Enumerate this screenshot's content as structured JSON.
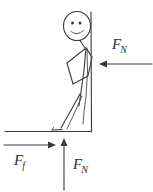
{
  "figure": {
    "type": "free-body-diagram",
    "title": "",
    "stroke_color": "#3a3a3a",
    "background_color": "#ffffff",
    "width": 153,
    "height": 192
  },
  "labels": {
    "normal_force_wall": {
      "base": "F",
      "subscript": "N"
    },
    "friction_force": {
      "base": "F",
      "subscript": "f"
    },
    "normal_force_ground": {
      "base": "F",
      "subscript": "N"
    }
  },
  "forces": [
    {
      "name": "normal-force-wall",
      "label_base": "F",
      "label_subscript": "N",
      "direction": "left",
      "tail": [
        152,
        64
      ],
      "head": [
        100,
        64
      ],
      "applied_at": "shoulder/hand contact with wall"
    },
    {
      "name": "friction-force-ground",
      "label_base": "F",
      "label_subscript": "f",
      "direction": "right",
      "tail": [
        4,
        145
      ],
      "head": [
        56,
        145
      ],
      "applied_at": "ground under feet"
    },
    {
      "name": "normal-force-ground",
      "label_base": "F",
      "label_subscript": "N",
      "direction": "up",
      "tail": [
        64,
        190
      ],
      "head": [
        64,
        139
      ],
      "applied_at": "ground under feet"
    }
  ],
  "scene": {
    "wall": {
      "name": "wall-line",
      "orientation": "vertical",
      "x": 91,
      "y_top": 12,
      "y_bottom": 132
    },
    "ground": {
      "name": "ground-line",
      "orientation": "horizontal",
      "y": 131,
      "x_left": 5,
      "x_right": 91
    },
    "figure_parts": [
      "head",
      "eye-left",
      "eye-right",
      "smile",
      "neck",
      "torso",
      "arms-diamond",
      "legs",
      "foot"
    ]
  }
}
